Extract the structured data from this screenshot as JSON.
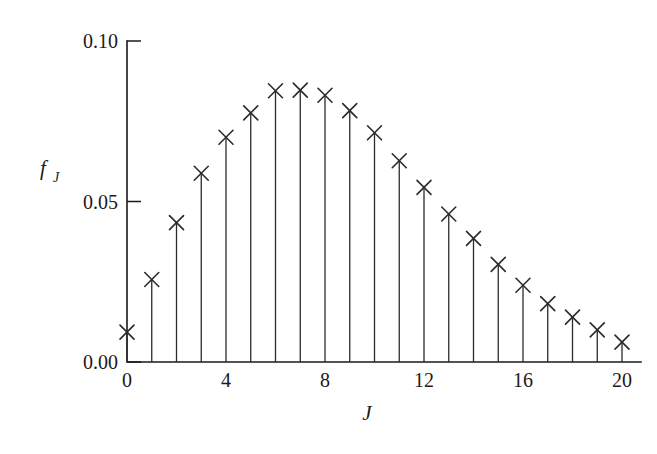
{
  "figure": {
    "background_color": "#ffffff",
    "ink_color": "#1a1a1a",
    "marker_symbol": "x-cross-marker"
  },
  "chart_data": {
    "type": "scatter",
    "plot_style": "stem-plot-with-x-markers",
    "title": "",
    "subtitle": "",
    "xlabel": "J",
    "ylabel": "f_J",
    "ylabel_base": "f",
    "ylabel_subscript": "J",
    "x": [
      0,
      1,
      2,
      3,
      4,
      5,
      6,
      7,
      8,
      9,
      10,
      11,
      12,
      13,
      14,
      15,
      16,
      17,
      18,
      19,
      20
    ],
    "values": [
      0.0093,
      0.0257,
      0.0434,
      0.0588,
      0.07,
      0.0776,
      0.0845,
      0.0847,
      0.0831,
      0.0783,
      0.0714,
      0.0627,
      0.0544,
      0.0461,
      0.0385,
      0.0304,
      0.0239,
      0.0182,
      0.014,
      0.01,
      0.0062
    ],
    "categories": [
      "0",
      "1",
      "2",
      "3",
      "4",
      "5",
      "6",
      "7",
      "8",
      "9",
      "10",
      "11",
      "12",
      "13",
      "14",
      "15",
      "16",
      "17",
      "18",
      "19",
      "20"
    ],
    "xlim": [
      -0.4,
      20.6
    ],
    "ylim": [
      0.0,
      0.1
    ],
    "xticks": [
      0,
      4,
      8,
      12,
      16,
      20
    ],
    "xticklabels": [
      "0",
      "4",
      "8",
      "12",
      "16",
      "20"
    ],
    "yticks": [
      0.0,
      0.05,
      0.1
    ],
    "yticklabels": [
      "0.00",
      "0.05",
      "0.10"
    ],
    "grid": false,
    "legend": null,
    "legend_position": "none",
    "annotations": [],
    "tick_direction": "in",
    "spines": [
      "left",
      "bottom"
    ]
  },
  "axes": {
    "y_tick_labels": [
      "0.10",
      "0.05",
      "0.00"
    ],
    "x_tick_labels": [
      "0",
      "4",
      "8",
      "12",
      "16",
      "20"
    ],
    "x_axis_title": "J",
    "y_axis_title_base": "f",
    "y_axis_title_sub": "J"
  }
}
